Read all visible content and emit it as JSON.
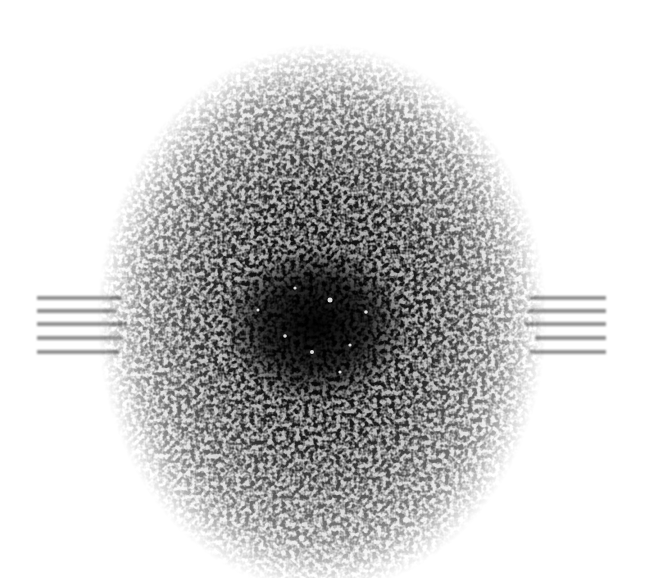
{
  "image": {
    "description": "Grayscale speckle / Fourier power-spectrum pattern: vertically elongated noisy ellipse, darkest at center, with horizontal streak lines on left and right sides",
    "background_color": "#ffffff",
    "ink_color": "#000000",
    "speckle": {
      "center": [
        322,
        318
      ],
      "radii": [
        225,
        275
      ],
      "core_center": [
        315,
        325
      ],
      "core_radii": [
        80,
        65
      ]
    },
    "streaks": {
      "left": {
        "x1": 37,
        "x2": 120,
        "ys": [
          298,
          311,
          324,
          338,
          352
        ]
      },
      "right": {
        "x1": 530,
        "x2": 606,
        "ys": [
          298,
          311,
          324,
          338,
          352
        ]
      },
      "color": "#8a8a8a"
    }
  }
}
